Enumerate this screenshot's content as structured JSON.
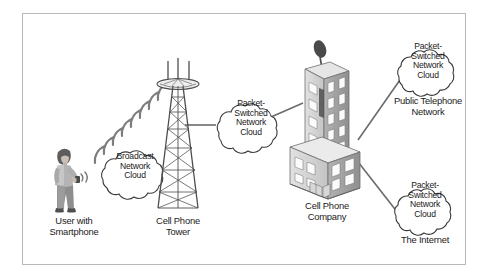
{
  "figure": {
    "background_color": "#ffffff",
    "frame_color": "#b8b8b8",
    "text_color": "#1a1a1a",
    "line_color": "#6b6b6b",
    "cloud_outline_color": "#3a3a3a"
  },
  "nodes": {
    "user": {
      "caption": "User with\nSmartphone",
      "icon": "person-with-smartphone-icon"
    },
    "broadcast_cloud": {
      "text": "Broadcast\nNetwork\nCloud",
      "icon": "cloud-icon"
    },
    "tower": {
      "caption": "Cell Phone\nTower",
      "icon": "cell-tower-icon"
    },
    "middle_cloud": {
      "text": "Packet-\nSwitched\nNetwork\nCloud",
      "icon": "cloud-icon"
    },
    "company": {
      "caption": "Cell Phone\nCompany",
      "icon": "office-building-icon"
    },
    "pstn_cloud": {
      "text": "Packet-\nSwitched\nNetwork\nCloud",
      "caption": "Public Telephone\nNetwork",
      "icon": "cloud-icon"
    },
    "internet_cloud": {
      "text": "Packet-\nSwitched\nNetwork\nCloud",
      "caption": "The Internet",
      "icon": "cloud-icon"
    }
  },
  "connections": [
    {
      "from": "user",
      "to": "tower",
      "style": "radio-waves"
    },
    {
      "from": "tower",
      "to": "middle_cloud",
      "style": "line"
    },
    {
      "from": "middle_cloud",
      "to": "company",
      "style": "line"
    },
    {
      "from": "company",
      "to": "pstn_cloud",
      "style": "line"
    },
    {
      "from": "company",
      "to": "internet_cloud",
      "style": "line"
    }
  ]
}
